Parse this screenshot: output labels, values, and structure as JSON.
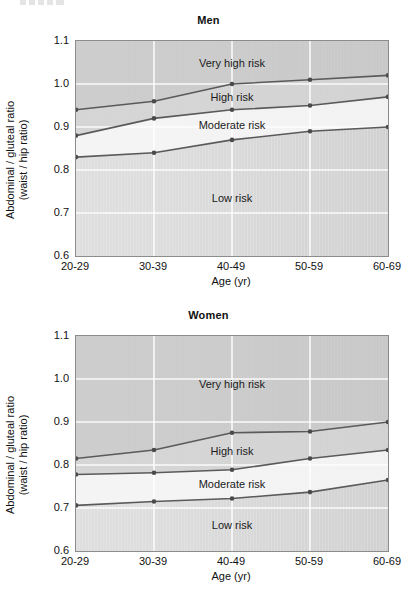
{
  "figure": {
    "axis_y_title_line1": "Abdominal / gluteal ratio",
    "axis_y_title_line2": "(waist / hip ratio)",
    "axis_x_title": "Age (yr)"
  },
  "panels": [
    {
      "key": "men",
      "title": "Men"
    },
    {
      "key": "women",
      "title": "Women"
    }
  ],
  "region_labels": {
    "very_high": "Very high risk",
    "high": "High risk",
    "moderate": "Moderate risk",
    "low": "Low risk"
  },
  "chart_data": [
    {
      "type": "line",
      "title": "Men",
      "xlabel": "Age (yr)",
      "ylabel": "Abdominal / gluteal ratio (waist / hip ratio)",
      "categories": [
        "20-29",
        "30-39",
        "40-49",
        "50-59",
        "60-69"
      ],
      "ylim": [
        0.6,
        1.1
      ],
      "yticks": [
        0.6,
        0.7,
        0.8,
        0.9,
        1.0,
        1.1
      ],
      "ytick_labels": [
        "0.6",
        "0.7",
        "0.8",
        "0.9",
        "1.0",
        "1.1"
      ],
      "grid": true,
      "legend": "none",
      "series": [
        {
          "name": "Very high risk threshold",
          "values": [
            0.94,
            0.96,
            1.0,
            1.01,
            1.02
          ]
        },
        {
          "name": "High risk threshold",
          "values": [
            0.88,
            0.92,
            0.94,
            0.95,
            0.97
          ]
        },
        {
          "name": "Moderate risk threshold",
          "values": [
            0.83,
            0.84,
            0.87,
            0.89,
            0.9
          ]
        }
      ],
      "regions": [
        {
          "label": "Very high risk",
          "above_series": "Very high risk threshold"
        },
        {
          "label": "High risk",
          "between": [
            "High risk threshold",
            "Very high risk threshold"
          ]
        },
        {
          "label": "Moderate risk",
          "between": [
            "Moderate risk threshold",
            "High risk threshold"
          ]
        },
        {
          "label": "Low risk",
          "below_series": "Moderate risk threshold"
        }
      ]
    },
    {
      "type": "line",
      "title": "Women",
      "xlabel": "Age (yr)",
      "ylabel": "Abdominal / gluteal ratio (waist / hip ratio)",
      "categories": [
        "20-29",
        "30-39",
        "40-49",
        "50-59",
        "60-69"
      ],
      "ylim": [
        0.6,
        1.1
      ],
      "yticks": [
        0.6,
        0.7,
        0.8,
        0.9,
        1.0,
        1.1
      ],
      "ytick_labels": [
        "0.6",
        "0.7",
        "0.8",
        "0.9",
        "1.0",
        "1.1"
      ],
      "grid": true,
      "legend": "none",
      "series": [
        {
          "name": "Very high risk threshold",
          "values": [
            0.815,
            0.835,
            0.875,
            0.878,
            0.9
          ]
        },
        {
          "name": "High risk threshold",
          "values": [
            0.778,
            0.782,
            0.789,
            0.815,
            0.835
          ]
        },
        {
          "name": "Moderate risk threshold",
          "values": [
            0.706,
            0.715,
            0.722,
            0.737,
            0.765
          ]
        }
      ],
      "regions": [
        {
          "label": "Very high risk",
          "above_series": "Very high risk threshold"
        },
        {
          "label": "High risk",
          "between": [
            "High risk threshold",
            "Very high risk threshold"
          ]
        },
        {
          "label": "Moderate risk",
          "between": [
            "Moderate risk threshold",
            "High risk threshold"
          ]
        },
        {
          "label": "Low risk",
          "below_series": "Moderate risk threshold"
        }
      ]
    }
  ],
  "colors": {
    "line": "#5a5a5a",
    "marker": "#4a4a4a",
    "plot_border": "#8c8c8c",
    "band_very_high": "#c9c9c9",
    "band_high": "#d4d4d4",
    "band_moderate": "#f4f4f4",
    "band_low": "#dcdcdc",
    "gridline": "#ffffff",
    "text": "#111111"
  }
}
